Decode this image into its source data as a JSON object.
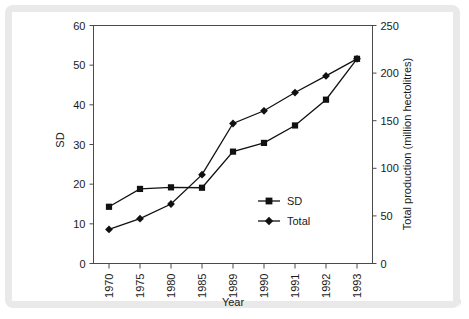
{
  "chart_data": {
    "type": "line",
    "title": "",
    "xlabel": "Year",
    "ylabel": "SD",
    "y2label": "Total production (million hectolitres)",
    "categories": [
      "1970",
      "1975",
      "1980",
      "1985",
      "1989",
      "1990",
      "1991",
      "1992",
      "1993"
    ],
    "ylim": [
      0,
      60
    ],
    "yticks": [
      0,
      10,
      20,
      30,
      40,
      50,
      60
    ],
    "y2lim": [
      0,
      250
    ],
    "y2ticks": [
      0,
      50,
      100,
      150,
      200,
      250
    ],
    "grid": false,
    "legend_position": "center-right-inside",
    "series": [
      {
        "name": "SD",
        "marker": "square",
        "axis": "left",
        "color": "#111111",
        "values": [
          14.3,
          18.8,
          19.2,
          19.1,
          28.2,
          30.4,
          34.8,
          41.3,
          51.6
        ]
      },
      {
        "name": "Total",
        "marker": "diamond",
        "axis": "left",
        "color": "#111111",
        "values": [
          8.6,
          11.3,
          15.0,
          22.4,
          35.3,
          38.5,
          43.1,
          47.3,
          51.6
        ],
        "values_right_axis": [
          36,
          47,
          62,
          93,
          147,
          160,
          180,
          197,
          215
        ]
      }
    ],
    "legend": [
      {
        "label": "SD",
        "marker": "square"
      },
      {
        "label": "Total",
        "marker": "diamond"
      }
    ]
  }
}
